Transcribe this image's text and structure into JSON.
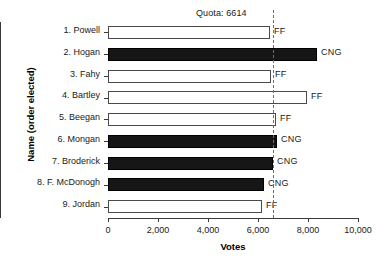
{
  "chart_data": {
    "type": "bar",
    "orientation": "horizontal",
    "title": "Quota: 6614",
    "xlabel": "Votes",
    "ylabel": "Name (order elected)",
    "xlim": [
      0,
      10000
    ],
    "xticks": [
      0,
      2000,
      4000,
      6000,
      8000,
      10000
    ],
    "xticklabels": [
      "0",
      "2,000",
      "4,000",
      "6,000",
      "8,000",
      "10,000"
    ],
    "grid": false,
    "legend": "none",
    "annotations": [
      {
        "name": "quota-line",
        "label": "Quota: 6614",
        "value": 6614,
        "style": "dashed-vertical"
      }
    ],
    "categories": [
      "1. Powell",
      "2. Hogan",
      "3. Fahy",
      "4. Bartley",
      "5. Beegan",
      "6. Mongan",
      "7. Broderick",
      "8. F. McDonogh",
      "9. Jordan"
    ],
    "values": [
      6480,
      8360,
      6520,
      7960,
      6720,
      6760,
      6600,
      6240,
      6160
    ],
    "party": [
      "FF",
      "CNG",
      "FF",
      "FF",
      "FF",
      "CNG",
      "CNG",
      "CNG",
      "FF"
    ],
    "bars": [
      {
        "category": "1. Powell",
        "value": 6480,
        "party": "FF",
        "fill": "#ffffff"
      },
      {
        "category": "2. Hogan",
        "value": 8360,
        "party": "CNG",
        "fill": "#161616"
      },
      {
        "category": "3. Fahy",
        "value": 6520,
        "party": "FF",
        "fill": "#ffffff"
      },
      {
        "category": "4. Bartley",
        "value": 7960,
        "party": "FF",
        "fill": "#ffffff"
      },
      {
        "category": "5. Beegan",
        "value": 6720,
        "party": "FF",
        "fill": "#ffffff"
      },
      {
        "category": "6. Mongan",
        "value": 6760,
        "party": "CNG",
        "fill": "#161616"
      },
      {
        "category": "7. Broderick",
        "value": 6600,
        "party": "CNG",
        "fill": "#161616"
      },
      {
        "category": "8. F. McDonogh",
        "value": 6240,
        "party": "CNG",
        "fill": "#161616"
      },
      {
        "category": "9. Jordan",
        "value": 6160,
        "party": "FF",
        "fill": "#ffffff"
      }
    ],
    "colors": {
      "ff": "#ffffff",
      "cng": "#161616",
      "axis": "#3a3a3a",
      "quota": "#6d6d6d",
      "text": "#1a1a1a"
    }
  }
}
